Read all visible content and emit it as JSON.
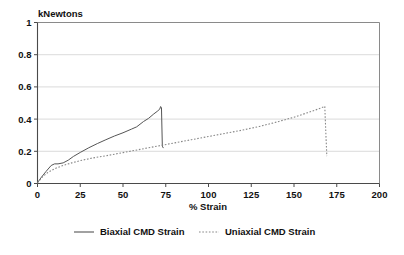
{
  "chart_data": {
    "type": "line",
    "title": "",
    "subtitle": "",
    "xlabel": "% Strain",
    "ylabel": "kNewtons",
    "ylabel_position": "above-axis",
    "xlim": [
      0,
      200
    ],
    "ylim": [
      0,
      1
    ],
    "xticks": [
      0,
      25,
      50,
      75,
      100,
      125,
      150,
      175,
      200
    ],
    "xtick_labels": [
      "0",
      "25",
      "50",
      "75",
      "100",
      "125",
      "150",
      "175",
      "200"
    ],
    "yticks": [
      0,
      0.2,
      0.4,
      0.6,
      0.8,
      1
    ],
    "ytick_labels": [
      "0",
      "0.2",
      "0.4",
      "0.6",
      "0.8",
      "1"
    ],
    "grid": "horizontal",
    "legend_position": "bottom",
    "series": [
      {
        "name": "Biaxial CMD Strain",
        "style": "solid",
        "color": "#555555",
        "x": [
          0,
          2,
          5,
          8,
          10,
          12,
          15,
          18,
          21,
          25,
          30,
          35,
          40,
          45,
          50,
          55,
          58,
          62,
          65,
          68,
          70,
          71.5,
          72,
          72.5,
          73,
          73.5
        ],
        "y": [
          0.005,
          0.035,
          0.075,
          0.112,
          0.122,
          0.122,
          0.128,
          0.145,
          0.168,
          0.193,
          0.222,
          0.248,
          0.272,
          0.295,
          0.315,
          0.338,
          0.352,
          0.385,
          0.405,
          0.432,
          0.448,
          0.462,
          0.478,
          0.47,
          0.232,
          0.222
        ]
      },
      {
        "name": "Uniaxial CMD Strain",
        "style": "dotted",
        "color": "#888888",
        "x": [
          0,
          3,
          6,
          10,
          15,
          20,
          25,
          32,
          40,
          50,
          60,
          70,
          80,
          90,
          100,
          110,
          120,
          130,
          140,
          150,
          158,
          164,
          167,
          168,
          168.6,
          169.2
        ],
        "y": [
          0.005,
          0.042,
          0.068,
          0.092,
          0.112,
          0.128,
          0.142,
          0.158,
          0.172,
          0.192,
          0.212,
          0.232,
          0.252,
          0.272,
          0.292,
          0.312,
          0.332,
          0.355,
          0.382,
          0.412,
          0.44,
          0.462,
          0.475,
          0.48,
          0.318,
          0.17
        ]
      }
    ]
  },
  "legend": {
    "items": [
      {
        "label": "Biaxial CMD Strain",
        "style": "solid"
      },
      {
        "label": "Uniaxial CMD Strain",
        "style": "dotted"
      }
    ]
  }
}
